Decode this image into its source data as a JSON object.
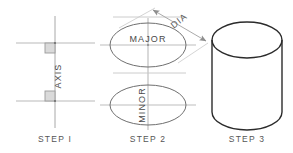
{
  "drawing": {
    "title": "Cylinder construction steps",
    "background_color": "#ffffff",
    "line_color_light": "#b9b9b9",
    "line_color_mid": "#8f8f8f",
    "line_color_dark": "#2b2b2b",
    "text_color": "#4a4a4a",
    "square_fill": "#d9d9d9"
  },
  "steps": [
    {
      "id": "step-1",
      "label": "STEP I",
      "label_x": 55,
      "label_y": 140,
      "axis_label": "AXIS",
      "axis_label_x": 61,
      "axis_label_y": 76,
      "axis_label_rotation": -90,
      "axis_line": {
        "x": 55,
        "y1": 16,
        "y2": 128
      },
      "centerlines": [
        {
          "x1": 16,
          "x2": 95,
          "y": 43
        },
        {
          "x1": 16,
          "x2": 95,
          "y": 101
        }
      ],
      "corner_squares": [
        {
          "x": 45,
          "y": 43,
          "size": 10
        },
        {
          "x": 45,
          "y": 91,
          "size": 10
        }
      ],
      "tick_points": [
        {
          "x": 55,
          "y": 43
        },
        {
          "x": 55,
          "y": 101
        }
      ]
    },
    {
      "id": "step-2",
      "label": "STEP 2",
      "label_x": 147,
      "label_y": 140,
      "axis_line": {
        "x": 148,
        "y1": 18,
        "y2": 130
      },
      "dimension": {
        "label": "DIA",
        "label_x": 180,
        "label_y": 24,
        "label_rotation": -38,
        "line_x1": 153,
        "line_y1": 10,
        "line_x2": 206,
        "line_y2": 41,
        "arrows": "both"
      },
      "ellipses": [
        {
          "name": "major",
          "label": "MAJOR",
          "label_rotation": 0,
          "cx": 148,
          "cy": 45,
          "rx": 38,
          "ry": 22,
          "centerline_h": {
            "x1": 100,
            "x2": 196,
            "y": 45
          },
          "tangents": [
            {
              "x1": 113,
              "y1": 17,
              "x2": 183,
              "y2": 17
            },
            {
              "x1": 113,
              "y1": 73,
              "x2": 183,
              "y2": 73
            }
          ]
        },
        {
          "name": "minor",
          "label": "MINOR",
          "label_rotation": -90,
          "cx": 148,
          "cy": 105,
          "rx": 38,
          "ry": 20,
          "centerline_h": {
            "x1": 100,
            "x2": 196,
            "y": 105
          }
        }
      ]
    },
    {
      "id": "step-3",
      "label": "STEP 3",
      "label_x": 235,
      "label_y": 140,
      "cylinder": {
        "cx": 247,
        "top_cy": 40,
        "bottom_cy": 112,
        "rx": 35,
        "ry": 18,
        "left_x": 212,
        "right_x": 282
      }
    }
  ]
}
